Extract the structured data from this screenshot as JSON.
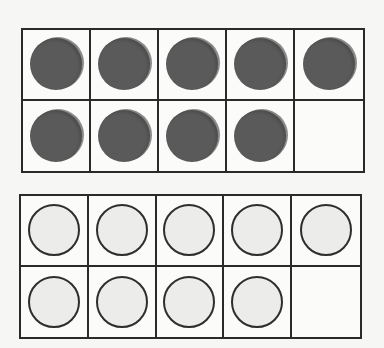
{
  "frames": [
    {
      "name": "ten-frame-top",
      "style": "filled",
      "count": 9,
      "cells": [
        1,
        1,
        1,
        1,
        1,
        1,
        1,
        1,
        1,
        0
      ]
    },
    {
      "name": "ten-frame-bottom",
      "style": "empty",
      "count": 9,
      "cells": [
        1,
        1,
        1,
        1,
        1,
        1,
        1,
        1,
        1,
        0
      ]
    }
  ],
  "colors": {
    "filled_counter": "#5a5a5a",
    "empty_counter_fill": "#ececea",
    "line": "#2a2a2a",
    "background": "#f6f6f4"
  }
}
